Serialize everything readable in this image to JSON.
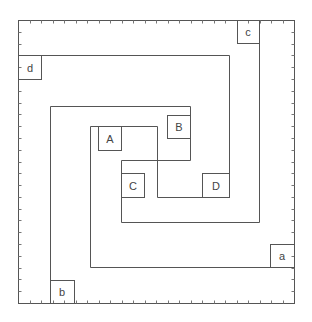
{
  "diagram": {
    "type": "nested-spiral-rectangles",
    "frame": {
      "x": 18,
      "y": 20,
      "width": 276,
      "height": 283,
      "tick_count_x": 24,
      "tick_count_y": 24
    },
    "stroke_color": "#555555",
    "labels": {
      "A": "A",
      "B": "B",
      "C": "C",
      "D": "D",
      "a": "a",
      "b": "b",
      "c": "c",
      "d": "d"
    }
  }
}
